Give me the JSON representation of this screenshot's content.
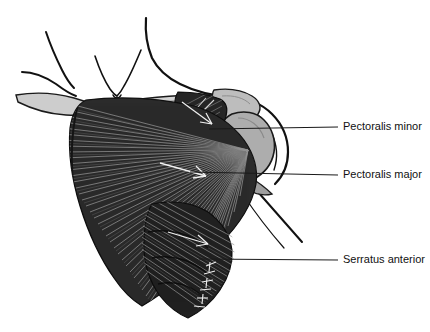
{
  "figure": {
    "type": "anatomical-illustration",
    "background_color": "#ffffff",
    "ink_color": "#111111",
    "muscle_color": "#2b2b2b",
    "bone_color": "#c9c9c9",
    "bone_mid_color": "#a9a9a9",
    "bone_light_color": "#dcdcdc"
  },
  "labels": [
    {
      "id": "pectoralis-minor",
      "text": "Pectoralis minor",
      "text_x": 343,
      "text_y": 127,
      "leader_x1": 209,
      "leader_y1": 129,
      "leader_x2": 338,
      "leader_y2": 127,
      "leader_width": 1.1
    },
    {
      "id": "pectoralis-major",
      "text": "Pectoralis major",
      "text_x": 343,
      "text_y": 175,
      "leader_x1": 190,
      "leader_y1": 172,
      "leader_x2": 338,
      "leader_y2": 175,
      "leader_width": 1.1
    },
    {
      "id": "serratus-anterior",
      "text": "Serratus anterior",
      "text_x": 343,
      "text_y": 260,
      "leader_x1": 199,
      "leader_y1": 259,
      "leader_x2": 338,
      "leader_y2": 260,
      "leader_width": 1.0
    }
  ],
  "structures": {
    "neck": "sternocleidomastoid-outline",
    "clavicle": "clavicle-bone",
    "acromion": "acromion-process",
    "humerus": "humeral-head",
    "pectoralis_major": "fan-striated-muscle",
    "pectoralis_minor": "triangular-striated-muscle",
    "serratus_anterior": "digitated-striated-muscle"
  }
}
